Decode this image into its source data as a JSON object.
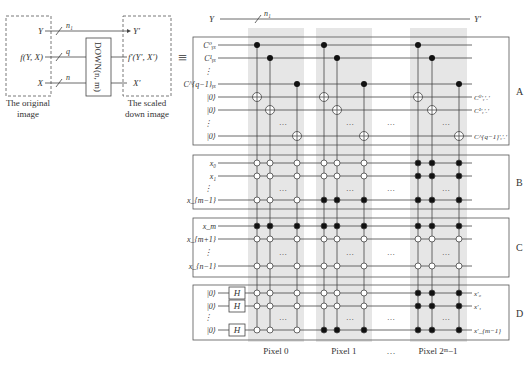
{
  "left_circuit": {
    "inputs": [
      {
        "label": "Y",
        "width": "n₁",
        "y": 31
      },
      {
        "label": "f(Y, X)",
        "width": "q",
        "y": 57
      },
      {
        "label": "X",
        "width": "n",
        "y": 83
      }
    ],
    "outputs": [
      {
        "label": "Y′",
        "y": 31
      },
      {
        "label": "f′(Y′, X′)",
        "y": 57
      },
      {
        "label": "X′",
        "y": 83
      }
    ],
    "gate_label": "DOWN(n, m)",
    "original_caption_line1": "The original",
    "original_caption_line2": "image",
    "scaled_caption_line1": "The scaled",
    "scaled_caption_line2": "down image",
    "equiv_symbol": "≡"
  },
  "right_circuit": {
    "top_wire": {
      "label_in": "Y",
      "label_out": "Y′",
      "width": "n₁"
    },
    "sections": [
      {
        "id": "A",
        "rows_in": [
          "C⁰ᵧₓ",
          "C¹ᵧₓ",
          "⋮",
          "C^{q−1}ᵧₓ",
          "|0⟩",
          "|0⟩",
          "⋮",
          "|0⟩"
        ],
        "rows_out": [
          "",
          "",
          "",
          "",
          "C⁰′ᵧ′ₓ′",
          "C¹′ᵧ′ₓ′",
          "",
          "C^{q−1}′ᵧ′ₓ′"
        ]
      },
      {
        "id": "B",
        "rows_in": [
          "x₀",
          "x₁",
          "⋮",
          "x_{m−1}"
        ]
      },
      {
        "id": "C",
        "rows_in": [
          "x_m",
          "x_{m+1}",
          "⋮",
          "x_{n−1}"
        ]
      },
      {
        "id": "D",
        "rows_in": [
          "|0⟩",
          "|0⟩",
          "⋮",
          "|0⟩"
        ],
        "gates": [
          "H",
          "H",
          "H"
        ],
        "rows_out": [
          "x′₀",
          "x′₁",
          "",
          "x′_{m−1}"
        ]
      }
    ],
    "pixel_labels": [
      "Pixel 0",
      "Pixel 1",
      "…",
      "Pixel 2ᵐ−1"
    ],
    "ellipsis": "…",
    "shading_color": "#e6e6e6",
    "line_color": "#444444"
  }
}
